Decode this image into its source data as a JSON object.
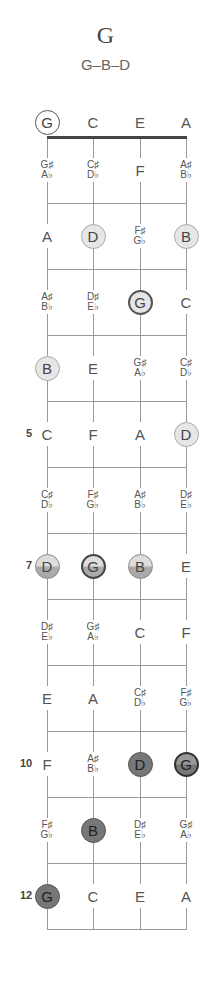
{
  "chord": {
    "name": "G",
    "notes": "G–B–D"
  },
  "fretboard": {
    "strings": [
      "G",
      "C",
      "E",
      "A"
    ],
    "fret_markers": [
      {
        "fret": 5,
        "label": "5"
      },
      {
        "fret": 7,
        "label": "7"
      },
      {
        "fret": 10,
        "label": "10"
      },
      {
        "fret": 12,
        "label": "12"
      }
    ],
    "rows": [
      {
        "fret": 0,
        "cells": [
          {
            "n": "G",
            "style": "open"
          },
          {
            "n": "C"
          },
          {
            "n": "E"
          },
          {
            "n": "A"
          }
        ]
      },
      {
        "fret": 1,
        "cells": [
          {
            "s": "G♯",
            "f": "A♭"
          },
          {
            "s": "C♯",
            "f": "D♭"
          },
          {
            "n": "F"
          },
          {
            "s": "A♯",
            "f": "B♭"
          }
        ]
      },
      {
        "fret": 2,
        "cells": [
          {
            "n": "A"
          },
          {
            "n": "D",
            "style": "light"
          },
          {
            "s": "F♯",
            "f": "G♭"
          },
          {
            "n": "B",
            "style": "light"
          }
        ]
      },
      {
        "fret": 3,
        "cells": [
          {
            "s": "A♯",
            "f": "B♭"
          },
          {
            "s": "D♯",
            "f": "E♭"
          },
          {
            "n": "G",
            "style": "light-root"
          },
          {
            "n": "C"
          }
        ]
      },
      {
        "fret": 4,
        "cells": [
          {
            "n": "B",
            "style": "light"
          },
          {
            "n": "E"
          },
          {
            "s": "G♯",
            "f": "A♭"
          },
          {
            "s": "C♯",
            "f": "D♭"
          }
        ]
      },
      {
        "fret": 5,
        "cells": [
          {
            "n": "C"
          },
          {
            "n": "F"
          },
          {
            "n": "A"
          },
          {
            "n": "D",
            "style": "light"
          }
        ]
      },
      {
        "fret": 6,
        "cells": [
          {
            "s": "C♯",
            "f": "D♭"
          },
          {
            "s": "F♯",
            "f": "G♭"
          },
          {
            "s": "A♯",
            "f": "B♭"
          },
          {
            "s": "D♯",
            "f": "E♭"
          }
        ]
      },
      {
        "fret": 7,
        "cells": [
          {
            "n": "D",
            "style": "mid"
          },
          {
            "n": "G",
            "style": "mid-root"
          },
          {
            "n": "B",
            "style": "mid"
          },
          {
            "n": "E"
          }
        ]
      },
      {
        "fret": 8,
        "cells": [
          {
            "s": "D♯",
            "f": "E♭"
          },
          {
            "s": "G♯",
            "f": "A♭"
          },
          {
            "n": "C"
          },
          {
            "n": "F"
          }
        ]
      },
      {
        "fret": 9,
        "cells": [
          {
            "n": "E"
          },
          {
            "n": "A"
          },
          {
            "s": "C♯",
            "f": "D♭"
          },
          {
            "s": "F♯",
            "f": "G♭"
          }
        ]
      },
      {
        "fret": 10,
        "cells": [
          {
            "n": "F"
          },
          {
            "s": "A♯",
            "f": "B♭"
          },
          {
            "n": "D",
            "style": "dark"
          },
          {
            "n": "G",
            "style": "dark-root"
          }
        ]
      },
      {
        "fret": 11,
        "cells": [
          {
            "s": "F♯",
            "f": "G♭"
          },
          {
            "n": "B",
            "style": "dark"
          },
          {
            "s": "D♯",
            "f": "E♭"
          },
          {
            "s": "G♯",
            "f": "A♭"
          }
        ]
      },
      {
        "fret": 12,
        "cells": [
          {
            "n": "G",
            "style": "dark"
          },
          {
            "n": "C"
          },
          {
            "n": "E"
          },
          {
            "n": "A"
          }
        ]
      }
    ]
  },
  "colors": {
    "line": "#999999",
    "nut": "#444444",
    "light_dot": "#e6e6e6",
    "dark_dot": "#777777"
  }
}
